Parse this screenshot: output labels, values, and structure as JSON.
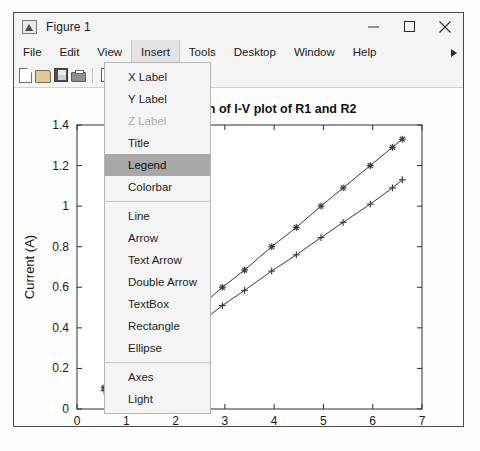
{
  "window": {
    "title": "Figure 1",
    "icon": "matlab-figure-icon",
    "controls": {
      "minimize": "minimize-icon",
      "maximize": "maximize-icon",
      "close": "close-icon"
    }
  },
  "menubar": {
    "items": [
      {
        "label": "File",
        "active": false
      },
      {
        "label": "Edit",
        "active": false
      },
      {
        "label": "View",
        "active": false
      },
      {
        "label": "Insert",
        "active": true
      },
      {
        "label": "Tools",
        "active": false
      },
      {
        "label": "Desktop",
        "active": false
      },
      {
        "label": "Window",
        "active": false
      },
      {
        "label": "Help",
        "active": false
      }
    ],
    "overflow": "overflow-arrow-icon"
  },
  "toolbar": {
    "buttons": [
      {
        "name": "new-figure-icon"
      },
      {
        "name": "open-file-icon"
      },
      {
        "name": "save-figure-icon"
      },
      {
        "name": "print-figure-icon"
      },
      {
        "name": "copy-icon"
      }
    ]
  },
  "insert_menu": {
    "open": true,
    "highlighted": "Legend",
    "groups": [
      [
        {
          "label": "X Label",
          "disabled": false
        },
        {
          "label": "Y Label",
          "disabled": false
        },
        {
          "label": "Z Label",
          "disabled": true
        },
        {
          "label": "Title",
          "disabled": false
        },
        {
          "label": "Legend",
          "disabled": false
        },
        {
          "label": "Colorbar",
          "disabled": false
        }
      ],
      [
        {
          "label": "Line",
          "disabled": false
        },
        {
          "label": "Arrow",
          "disabled": false
        },
        {
          "label": "Text Arrow",
          "disabled": false
        },
        {
          "label": "Double Arrow",
          "disabled": false
        },
        {
          "label": "TextBox",
          "disabled": false
        },
        {
          "label": "Rectangle",
          "disabled": false
        },
        {
          "label": "Ellipse",
          "disabled": false
        }
      ],
      [
        {
          "label": "Axes",
          "disabled": false
        },
        {
          "label": "Light",
          "disabled": false
        }
      ]
    ]
  },
  "chart_data": {
    "type": "line",
    "title": "Comparison of I-V plot of R1 and R2",
    "xlabel": "Voltage (V)",
    "ylabel": "Current (A)",
    "xlim": [
      0,
      7
    ],
    "ylim": [
      0,
      1.4
    ],
    "xticks": [
      0,
      1,
      2,
      3,
      4,
      5,
      6,
      7
    ],
    "yticks": [
      0,
      0.2,
      0.4,
      0.6,
      0.8,
      1,
      1.2,
      1.4
    ],
    "ytick_labels": [
      "0",
      "0.2",
      "0.4",
      "0.6",
      "0.8",
      "1",
      "1.2",
      "1.4"
    ],
    "grid": false,
    "legend": null,
    "series": [
      {
        "name": "R1",
        "marker": "asterisk",
        "color": "#3a3a3a",
        "x": [
          0.55,
          0.95,
          1.45,
          2.0,
          2.55,
          2.95,
          3.4,
          3.95,
          4.45,
          4.95,
          5.4,
          5.95,
          6.4,
          6.6
        ],
        "y": [
          0.105,
          0.19,
          0.29,
          0.4,
          0.515,
          0.6,
          0.685,
          0.8,
          0.895,
          1.0,
          1.09,
          1.2,
          1.29,
          1.33
        ]
      },
      {
        "name": "R2",
        "marker": "plus",
        "color": "#3a3a3a",
        "x": [
          0.55,
          0.95,
          1.45,
          2.0,
          2.55,
          2.95,
          3.4,
          3.95,
          4.45,
          4.95,
          5.4,
          5.95,
          6.4,
          6.6
        ],
        "y": [
          0.09,
          0.16,
          0.245,
          0.34,
          0.435,
          0.51,
          0.585,
          0.68,
          0.76,
          0.845,
          0.92,
          1.01,
          1.09,
          1.13
        ]
      }
    ]
  }
}
